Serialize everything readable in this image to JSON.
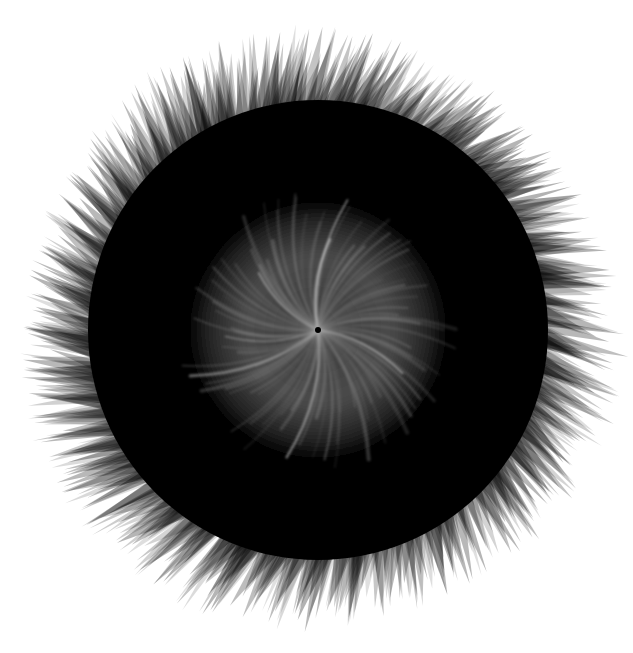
{
  "artwork": {
    "description": "Abstract radial burst: dense black disc with translucent gray jagged spike fringe and a lighter swirling streaked center",
    "canvas": {
      "width": 633,
      "height": 653,
      "background": "#ffffff"
    },
    "center": {
      "x": 318,
      "y": 330
    },
    "outer_radius": 290,
    "dark_radius": 230,
    "inner_radius": 135,
    "colors": {
      "core": "#000000",
      "fringe": "#000000",
      "inner_glow": "#5a5a5a",
      "streak": "#9a9a9a",
      "highlight": "#d0d0d0"
    },
    "spike_layers": 5,
    "spikes_per_layer": 140,
    "swirl_streaks": 90,
    "swirl_twist_degrees": 40
  }
}
